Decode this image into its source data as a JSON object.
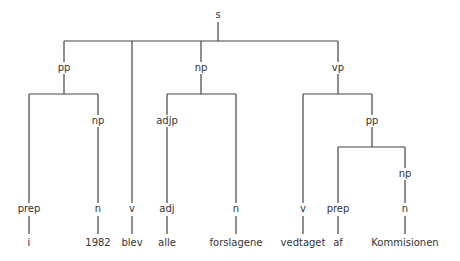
{
  "tree": {
    "root": "s",
    "nodes": [
      {
        "id": "s",
        "label": "s",
        "x": 218,
        "y": 15
      },
      {
        "id": "pp1",
        "label": "pp",
        "x": 64,
        "y": 68
      },
      {
        "id": "np1",
        "label": "np",
        "x": 201,
        "y": 68
      },
      {
        "id": "vp",
        "label": "vp",
        "x": 338,
        "y": 68
      },
      {
        "id": "np2",
        "label": "np",
        "x": 98,
        "y": 121
      },
      {
        "id": "adjp",
        "label": "adjp",
        "x": 167,
        "y": 121
      },
      {
        "id": "pp2",
        "label": "pp",
        "x": 372,
        "y": 121
      },
      {
        "id": "np3",
        "label": "np",
        "x": 405,
        "y": 174
      },
      {
        "id": "prep1",
        "label": "prep",
        "x": 29,
        "y": 209
      },
      {
        "id": "n1",
        "label": "n",
        "x": 98,
        "y": 209
      },
      {
        "id": "v1",
        "label": "v",
        "x": 132,
        "y": 209
      },
      {
        "id": "adj",
        "label": "adj",
        "x": 167,
        "y": 209
      },
      {
        "id": "n2",
        "label": "n",
        "x": 236,
        "y": 209
      },
      {
        "id": "v2",
        "label": "v",
        "x": 303,
        "y": 209
      },
      {
        "id": "prep2",
        "label": "prep",
        "x": 338,
        "y": 209
      },
      {
        "id": "n3",
        "label": "n",
        "x": 405,
        "y": 209
      }
    ],
    "words": [
      {
        "text": "i",
        "x": 29,
        "y": 243
      },
      {
        "text": "1982",
        "x": 98,
        "y": 243
      },
      {
        "text": "blev",
        "x": 132,
        "y": 243
      },
      {
        "text": "alle",
        "x": 167,
        "y": 243
      },
      {
        "text": "forslagene",
        "x": 236,
        "y": 243
      },
      {
        "text": "vedtaget",
        "x": 303,
        "y": 243
      },
      {
        "text": "af",
        "x": 338,
        "y": 243
      },
      {
        "text": "Kommisionen",
        "x": 405,
        "y": 243
      }
    ]
  }
}
